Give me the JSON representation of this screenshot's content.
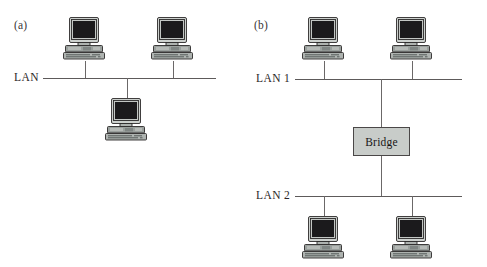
{
  "figure": {
    "width": 487,
    "height": 267,
    "background": "#ffffff",
    "caption_a": "(a)",
    "caption_b": "(b)"
  },
  "colors": {
    "line": "#5d5a5a",
    "stem": "#6b6868",
    "bridge_fill": "#c8ccc9",
    "bridge_stroke": "#4a4747",
    "monitor_case": "#b9bdba",
    "monitor_case_light": "#d5d8d6",
    "screen": "#1b1a1c",
    "base": "#8e9391",
    "keyboard": "#a8adaa",
    "outline": "#2c2a2a",
    "text": "#231f1f"
  },
  "panel_a": {
    "label": "(a)",
    "bus_label": "LAN",
    "bus": {
      "x": 43,
      "y": 78,
      "width": 173
    },
    "nodes": [
      {
        "name": "workstation-a-top-left",
        "x": 62,
        "y": 16,
        "stem_x": 85,
        "stem_from": 61,
        "stem_to": 78
      },
      {
        "name": "workstation-a-top-right",
        "x": 150,
        "y": 16,
        "stem_x": 173,
        "stem_from": 61,
        "stem_to": 78
      },
      {
        "name": "workstation-a-bottom",
        "x": 104,
        "y": 97,
        "stem_x": 127,
        "stem_from": 78,
        "stem_to": 98
      }
    ]
  },
  "panel_b": {
    "label": "(b)",
    "bus1_label": "LAN 1",
    "bus2_label": "LAN 2",
    "bus1": {
      "x": 295,
      "y": 79,
      "width": 167
    },
    "bus2": {
      "x": 295,
      "y": 196,
      "width": 167
    },
    "bridge": {
      "label": "Bridge",
      "x": 353,
      "y": 127,
      "width": 57,
      "height": 29
    },
    "trunk_top": {
      "x": 381,
      "from": 79,
      "to": 127
    },
    "trunk_bottom": {
      "x": 381,
      "from": 156,
      "to": 196
    },
    "nodes": [
      {
        "name": "workstation-b-top-left",
        "x": 301,
        "y": 16,
        "stem_x": 324,
        "stem_from": 61,
        "stem_to": 79
      },
      {
        "name": "workstation-b-top-right",
        "x": 389,
        "y": 16,
        "stem_x": 412,
        "stem_from": 61,
        "stem_to": 79
      },
      {
        "name": "workstation-b-bottom-left",
        "x": 301,
        "y": 215,
        "stem_x": 324,
        "stem_from": 196,
        "stem_to": 216
      },
      {
        "name": "workstation-b-bottom-right",
        "x": 389,
        "y": 215,
        "stem_x": 412,
        "stem_from": 196,
        "stem_to": 216
      }
    ]
  },
  "diagram_text": {
    "lan": "LAN",
    "lan1": "LAN 1",
    "lan2": "LAN 2",
    "bridge": "Bridge",
    "a": "(a)",
    "b": "(b)"
  }
}
